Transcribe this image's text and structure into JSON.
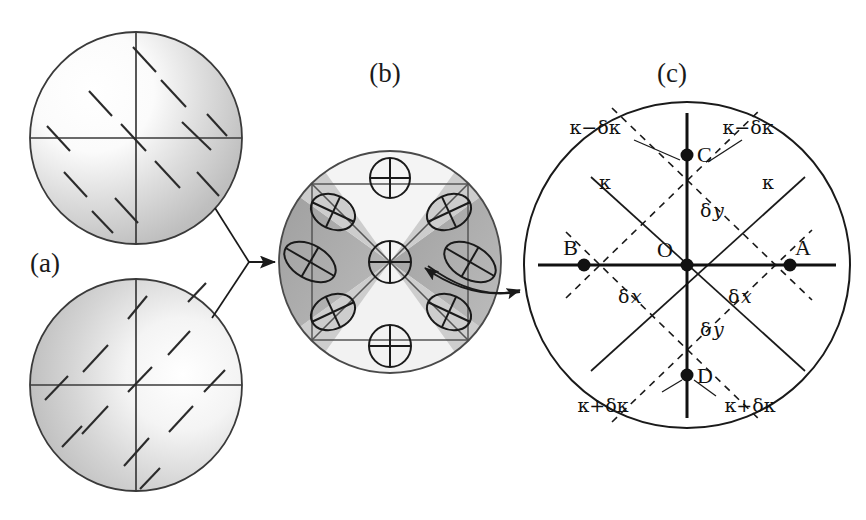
{
  "figure": {
    "type": "scientific-diagram",
    "caption_panels": [
      "(a)",
      "(b)",
      "(c)"
    ],
    "background": "#ffffff",
    "ink": "#1a1a1a"
  },
  "panels": {
    "a": {
      "label": "(a)",
      "label_pos": {
        "x": 30,
        "y": 272
      },
      "circles": [
        {
          "name": "top-circle",
          "cx": 136,
          "cy": 138,
          "r": 106,
          "shading": "light-upper-left-to-dark-lower-right",
          "tick_angle_deg": 45,
          "ticks": 12
        },
        {
          "name": "bottom-circle",
          "cx": 136,
          "cy": 385,
          "r": 106,
          "shading": "dark-left-to-light-right",
          "tick_angle_deg": -45,
          "ticks": 12
        }
      ],
      "crosshair": true
    },
    "b": {
      "label": "(b)",
      "label_pos": {
        "x": 385,
        "y": 82
      },
      "circle": {
        "cx": 390,
        "cy": 262,
        "r": 112
      },
      "sectors": 8,
      "glyph": "crossed-circle",
      "glyph_count": 9,
      "glyphs": [
        {
          "cx": 390,
          "cy": 178,
          "rx": 20,
          "ry": 20,
          "rot": 0
        },
        {
          "cx": 390,
          "cy": 346,
          "rx": 21,
          "ry": 21,
          "rot": 0
        },
        {
          "cx": 310,
          "cy": 262,
          "rx": 27,
          "ry": 17,
          "rot": 30
        },
        {
          "cx": 470,
          "cy": 262,
          "rx": 27,
          "ry": 17,
          "rot": 30
        },
        {
          "cx": 390,
          "cy": 262,
          "rx": 21,
          "ry": 21,
          "rot": 0
        },
        {
          "cx": 332,
          "cy": 212,
          "rx": 22,
          "ry": 17,
          "rot": 25
        },
        {
          "cx": 448,
          "cy": 212,
          "rx": 22,
          "ry": 17,
          "rot": -25
        },
        {
          "cx": 332,
          "cy": 312,
          "rx": 22,
          "ry": 17,
          "rot": -25
        },
        {
          "cx": 448,
          "cy": 312,
          "rx": 22,
          "ry": 17,
          "rot": 25
        }
      ]
    },
    "c": {
      "label": "(c)",
      "label_pos": {
        "x": 672,
        "y": 82
      },
      "circle": {
        "cx": 687,
        "cy": 265,
        "r": 163
      },
      "points": [
        {
          "id": "O",
          "label": "O",
          "x": 687,
          "y": 265,
          "label_dx": -22,
          "label_dy": -8
        },
        {
          "id": "A",
          "label": "A",
          "x": 790,
          "y": 265,
          "label_dx": 2,
          "label_dy": -10
        },
        {
          "id": "B",
          "label": "B",
          "x": 584,
          "y": 265,
          "label_dx": -22,
          "label_dy": -10
        },
        {
          "id": "C",
          "label": "C",
          "x": 687,
          "y": 155,
          "label_dx": 9,
          "label_dy": 7
        },
        {
          "id": "D",
          "label": "D",
          "x": 687,
          "y": 375,
          "label_dx": 9,
          "label_dy": 7
        }
      ],
      "labels": [
        {
          "name": "kappa-minus-left",
          "text": "κ−δκ",
          "x": 595,
          "y": 134,
          "anchor": "middle"
        },
        {
          "name": "kappa-minus-right",
          "text": "κ−δκ",
          "x": 745,
          "y": 134,
          "anchor": "middle"
        },
        {
          "name": "kappa-left",
          "text": "κ",
          "x": 607,
          "y": 187,
          "anchor": "middle"
        },
        {
          "name": "kappa-right",
          "text": "κ",
          "x": 765,
          "y": 187,
          "anchor": "middle"
        },
        {
          "name": "kappa-plus-left",
          "text": "κ+δκ",
          "x": 603,
          "y": 410,
          "anchor": "middle"
        },
        {
          "name": "kappa-plus-right",
          "text": "κ+δκ",
          "x": 748,
          "y": 410,
          "anchor": "middle"
        }
      ],
      "delta_labels": [
        {
          "name": "delta-y-top",
          "greek": "δ",
          "italic": "y",
          "x": 700,
          "y": 212
        },
        {
          "name": "delta-y-bottom",
          "greek": "δ",
          "italic": "y",
          "x": 700,
          "y": 330
        },
        {
          "name": "delta-x-left",
          "greek": "δ",
          "italic": "x",
          "x": 623,
          "y": 298
        },
        {
          "name": "delta-x-right",
          "greek": "δ",
          "italic": "x",
          "x": 733,
          "y": 298
        }
      ]
    }
  },
  "connectors": [
    {
      "name": "a-to-b-arrow",
      "kind": "y-junction-arrow",
      "direction": "right"
    },
    {
      "name": "c-to-b-arrow",
      "kind": "curved-double-arrow",
      "direction": "bidirectional"
    }
  ]
}
